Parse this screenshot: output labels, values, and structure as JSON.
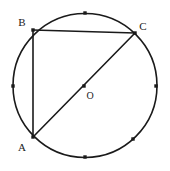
{
  "figure": {
    "type": "circle-geometry-diagram",
    "background_color": "#ffffff",
    "stroke_color": "#1a1a1a",
    "marker_color": "#1a1a1a",
    "label_color": "#1a1a1a",
    "circle": {
      "center_x": 85,
      "center_y": 85.5,
      "radius": 72,
      "stroke_width": 1.6
    },
    "points": [
      {
        "id": "B",
        "label": "B",
        "x": 33,
        "y": 30,
        "label_x": 22,
        "label_y": 26,
        "marker": true
      },
      {
        "id": "C",
        "label": "C",
        "x": 135,
        "y": 33,
        "label_x": 143,
        "label_y": 30,
        "marker": true
      },
      {
        "id": "A",
        "label": "A",
        "x": 33,
        "y": 137,
        "label_x": 22,
        "label_y": 151,
        "marker": true
      },
      {
        "id": "O",
        "label": "O",
        "x": 84,
        "y": 86,
        "label_x": 90,
        "label_y": 99,
        "marker": true
      }
    ],
    "arc_markers": [
      {
        "id": "top",
        "x": 85,
        "y": 13
      },
      {
        "id": "left",
        "x": 13,
        "y": 86
      },
      {
        "id": "right",
        "x": 156,
        "y": 86
      },
      {
        "id": "bottom",
        "x": 85,
        "y": 157
      },
      {
        "id": "lower-right",
        "x": 133,
        "y": 139
      }
    ],
    "segments": [
      {
        "id": "BC",
        "from": "B",
        "to": "C",
        "x1": 33,
        "y1": 30,
        "x2": 135,
        "y2": 33,
        "stroke_width": 1.6
      },
      {
        "id": "BA",
        "from": "B",
        "to": "A",
        "x1": 33,
        "y1": 30,
        "x2": 33,
        "y2": 137,
        "stroke_width": 1.6
      },
      {
        "id": "AC",
        "from": "A",
        "to": "C",
        "x1": 33,
        "y1": 137,
        "x2": 135,
        "y2": 33,
        "stroke_width": 1.6
      }
    ],
    "marker_size": 3.4
  }
}
